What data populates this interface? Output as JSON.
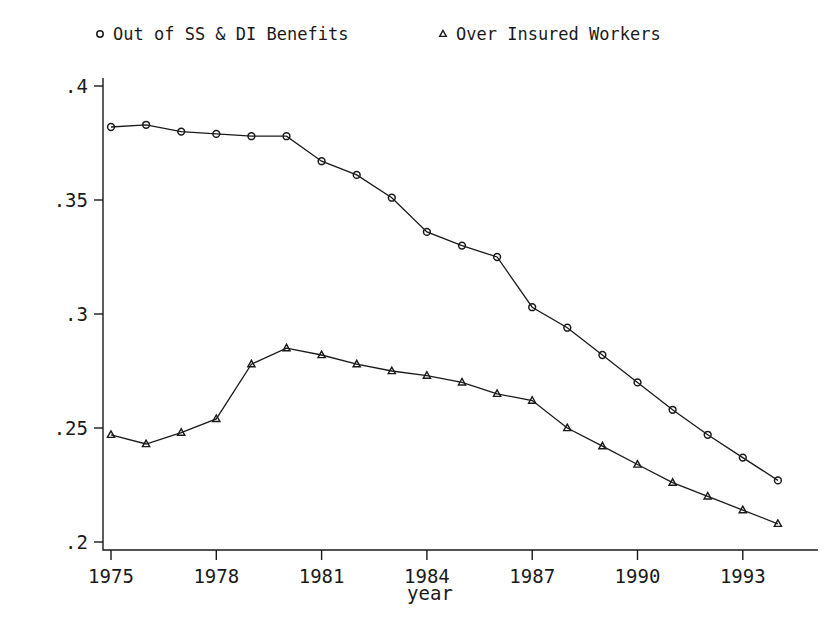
{
  "chart_data": {
    "type": "line",
    "title": "",
    "xlabel": "year",
    "ylabel": "",
    "grid": false,
    "legend_position": "top",
    "xlim": [
      1974.3,
      1994.7
    ],
    "ylim": [
      0.195,
      0.405
    ],
    "x": [
      1975,
      1976,
      1977,
      1978,
      1979,
      1980,
      1981,
      1982,
      1983,
      1984,
      1985,
      1986,
      1987,
      1988,
      1989,
      1990,
      1991,
      1992,
      1993,
      1994
    ],
    "xticks": [
      1975,
      1978,
      1981,
      1984,
      1987,
      1990,
      1993
    ],
    "xtick_labels": [
      "1975",
      "1978",
      "1981",
      "1984",
      "1987",
      "1990",
      "1993"
    ],
    "yticks": [
      0.2,
      0.25,
      0.3,
      0.35,
      0.4
    ],
    "ytick_labels": [
      ".2",
      ".25",
      ".3",
      ".35",
      ".4"
    ],
    "series": [
      {
        "name": "Out of SS & DI Benefits",
        "marker": "circle",
        "values": [
          0.382,
          0.383,
          0.38,
          0.379,
          0.378,
          0.378,
          0.367,
          0.361,
          0.351,
          0.336,
          0.33,
          0.325,
          0.303,
          0.294,
          0.282,
          0.27,
          0.258,
          0.247,
          0.237,
          0.227
        ]
      },
      {
        "name": "Over Insured Workers",
        "marker": "triangle",
        "values": [
          0.247,
          0.243,
          0.248,
          0.254,
          0.278,
          0.285,
          0.282,
          0.278,
          0.275,
          0.273,
          0.27,
          0.265,
          0.262,
          0.25,
          0.242,
          0.234,
          0.226,
          0.22,
          0.214,
          0.208
        ]
      }
    ]
  },
  "legend": {
    "entries": [
      {
        "label": "Out of SS & DI Benefits",
        "marker": "circle-marker-icon"
      },
      {
        "label": "Over Insured Workers",
        "marker": "triangle-marker-icon"
      }
    ]
  },
  "axes": {
    "x_title": "year"
  },
  "colors": {
    "ink": "#1a1a1a",
    "background": "#ffffff"
  }
}
